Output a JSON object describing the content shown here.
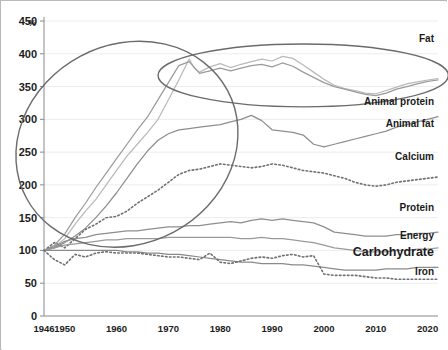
{
  "chart_data": {
    "type": "line",
    "title": "",
    "subtitle": "",
    "xlabel": "",
    "ylabel": "%",
    "ylim": [
      0,
      450
    ],
    "xlim": [
      1946,
      2022
    ],
    "grid": true,
    "legend_position": "right-inline",
    "yticks": [
      0,
      50,
      100,
      150,
      200,
      250,
      300,
      350,
      400,
      450
    ],
    "xticks": [
      1946,
      1950,
      1960,
      1970,
      1980,
      1990,
      2000,
      2010,
      2020
    ],
    "axis_note": "Index, 1946 = 100%",
    "series": [
      {
        "name": "Fat",
        "color": "#b9b9b9",
        "style": "solid",
        "label_x": 1999,
        "label_y": 418,
        "x": [
          1946,
          1948,
          1950,
          1952,
          1954,
          1956,
          1958,
          1960,
          1962,
          1964,
          1966,
          1968,
          1970,
          1972,
          1974,
          1975,
          1976,
          1978,
          1980,
          1982,
          1984,
          1986,
          1988,
          1990,
          1992,
          1994,
          1996,
          1998,
          2000,
          2002,
          2004,
          2006,
          2008,
          2010,
          2012,
          2014,
          2016,
          2018,
          2020,
          2022
        ],
        "values": [
          100,
          105,
          118,
          140,
          160,
          178,
          200,
          222,
          244,
          262,
          280,
          300,
          330,
          360,
          392,
          378,
          372,
          380,
          385,
          379,
          384,
          388,
          392,
          389,
          396,
          393,
          383,
          372,
          361,
          352,
          347,
          344,
          340,
          339,
          344,
          349,
          354,
          357,
          360,
          362
        ]
      },
      {
        "name": "Animal protein",
        "color": "#9b9b9b",
        "style": "solid",
        "label_x": 2004,
        "label_y": 322,
        "x": [
          1946,
          1948,
          1950,
          1952,
          1954,
          1956,
          1958,
          1960,
          1962,
          1964,
          1966,
          1968,
          1970,
          1972,
          1974,
          1976,
          1978,
          1980,
          1982,
          1984,
          1986,
          1988,
          1990,
          1992,
          1994,
          1996,
          1998,
          2000,
          2002,
          2004,
          2006,
          2008,
          2010,
          2012,
          2014,
          2016,
          2018,
          2020,
          2022
        ],
        "values": [
          100,
          108,
          125,
          150,
          172,
          196,
          218,
          240,
          262,
          284,
          304,
          330,
          356,
          382,
          388,
          370,
          374,
          378,
          374,
          378,
          382,
          384,
          380,
          386,
          381,
          372,
          364,
          356,
          350,
          346,
          342,
          338,
          336,
          340,
          346,
          350,
          354,
          358,
          360
        ]
      },
      {
        "name": "Animal fat",
        "color": "#8e8e8e",
        "style": "solid",
        "label_x": 2006,
        "label_y": 288,
        "x": [
          1946,
          1948,
          1950,
          1952,
          1954,
          1956,
          1958,
          1960,
          1962,
          1964,
          1966,
          1968,
          1970,
          1972,
          1974,
          1976,
          1978,
          1980,
          1982,
          1984,
          1986,
          1988,
          1990,
          1992,
          1994,
          1996,
          1998,
          2000,
          2002,
          2004,
          2006,
          2008,
          2010,
          2012,
          2014,
          2016,
          2018,
          2020,
          2022
        ],
        "values": [
          100,
          104,
          112,
          122,
          134,
          150,
          168,
          188,
          210,
          232,
          252,
          268,
          278,
          284,
          286,
          288,
          290,
          292,
          296,
          300,
          306,
          298,
          284,
          282,
          280,
          276,
          262,
          258,
          262,
          266,
          270,
          274,
          278,
          282,
          288,
          292,
          296,
          300,
          304
        ]
      },
      {
        "name": "Calcium",
        "color": "#707070",
        "style": "dotted",
        "label_x": 2006,
        "label_y": 238,
        "x": [
          1946,
          1948,
          1950,
          1952,
          1954,
          1956,
          1958,
          1960,
          1962,
          1964,
          1966,
          1968,
          1970,
          1972,
          1974,
          1976,
          1978,
          1980,
          1982,
          1984,
          1986,
          1988,
          1990,
          1992,
          1994,
          1996,
          1998,
          2000,
          2002,
          2004,
          2006,
          2008,
          2010,
          2012,
          2014,
          2016,
          2018,
          2020,
          2022
        ],
        "values": [
          100,
          112,
          104,
          118,
          132,
          140,
          150,
          152,
          160,
          172,
          182,
          192,
          204,
          216,
          222,
          224,
          228,
          232,
          230,
          228,
          226,
          228,
          232,
          230,
          226,
          222,
          220,
          218,
          214,
          210,
          204,
          200,
          198,
          200,
          204,
          206,
          208,
          210,
          212
        ]
      },
      {
        "name": "Protein",
        "color": "#8e8e8e",
        "style": "solid",
        "label_x": 2005,
        "label_y": 160,
        "x": [
          1946,
          1948,
          1950,
          1952,
          1954,
          1956,
          1958,
          1960,
          1962,
          1964,
          1966,
          1968,
          1970,
          1972,
          1974,
          1976,
          1978,
          1980,
          1982,
          1984,
          1986,
          1988,
          1990,
          1992,
          1994,
          1996,
          1998,
          2000,
          2002,
          2004,
          2006,
          2008,
          2010,
          2012,
          2014,
          2016,
          2018,
          2020,
          2022
        ],
        "values": [
          100,
          106,
          114,
          118,
          120,
          124,
          126,
          128,
          130,
          130,
          132,
          134,
          136,
          136,
          138,
          138,
          140,
          142,
          144,
          142,
          146,
          148,
          146,
          148,
          146,
          144,
          142,
          136,
          128,
          126,
          124,
          122,
          122,
          122,
          124,
          124,
          126,
          126,
          128
        ]
      },
      {
        "name": "Energy",
        "color": "#9a9a9a",
        "style": "solid",
        "label_x": 2011,
        "label_y": 118,
        "x": [
          1946,
          1948,
          1950,
          1952,
          1954,
          1956,
          1958,
          1960,
          1962,
          1964,
          1966,
          1968,
          1970,
          1972,
          1974,
          1976,
          1978,
          1980,
          1982,
          1984,
          1986,
          1988,
          1990,
          1992,
          1994,
          1996,
          1998,
          2000,
          2002,
          2004,
          2006,
          2008,
          2010,
          2012,
          2014,
          2016,
          2018,
          2020,
          2022
        ],
        "values": [
          100,
          104,
          108,
          110,
          112,
          114,
          116,
          116,
          118,
          118,
          118,
          118,
          120,
          120,
          120,
          120,
          120,
          120,
          120,
          118,
          118,
          120,
          118,
          118,
          116,
          114,
          112,
          108,
          104,
          102,
          100,
          98,
          98,
          98,
          100,
          100,
          102,
          102,
          104
        ]
      },
      {
        "name": "Carbohydrate",
        "color": "#8a8a8a",
        "style": "solid",
        "label_x": 1998,
        "label_y": 92,
        "x": [
          1946,
          1948,
          1950,
          1952,
          1954,
          1956,
          1958,
          1960,
          1962,
          1964,
          1966,
          1968,
          1970,
          1972,
          1974,
          1976,
          1978,
          1980,
          1982,
          1984,
          1986,
          1988,
          1990,
          1992,
          1994,
          1996,
          1998,
          2000,
          2002,
          2004,
          2006,
          2008,
          2010,
          2012,
          2014,
          2016,
          2018,
          2020,
          2022
        ],
        "values": [
          100,
          100,
          100,
          100,
          100,
          100,
          100,
          100,
          98,
          98,
          96,
          96,
          94,
          94,
          92,
          90,
          88,
          86,
          84,
          82,
          82,
          80,
          80,
          80,
          78,
          78,
          76,
          74,
          72,
          70,
          70,
          70,
          70,
          72,
          72,
          72,
          74,
          74,
          74
        ]
      },
      {
        "name": "Iron",
        "color": "#707070",
        "style": "dotted",
        "label_x": 2013,
        "label_y": 62,
        "x": [
          1946,
          1948,
          1950,
          1952,
          1954,
          1956,
          1958,
          1960,
          1962,
          1964,
          1966,
          1968,
          1970,
          1972,
          1974,
          1976,
          1978,
          1980,
          1982,
          1984,
          1986,
          1988,
          1990,
          1992,
          1994,
          1996,
          1998,
          2000,
          2002,
          2004,
          2006,
          2008,
          2010,
          2012,
          2014,
          2016,
          2018,
          2020,
          2022
        ],
        "values": [
          100,
          86,
          78,
          94,
          90,
          96,
          98,
          96,
          96,
          96,
          94,
          92,
          90,
          90,
          88,
          86,
          96,
          82,
          80,
          84,
          88,
          90,
          88,
          92,
          94,
          90,
          92,
          64,
          62,
          62,
          62,
          60,
          58,
          58,
          56,
          56,
          56,
          56,
          56
        ]
      }
    ],
    "annotations": [
      {
        "name": "rising-phase-ellipse",
        "shape": "ellipse",
        "cx": 1962,
        "cy": 262,
        "rx": 22,
        "ry": 152,
        "rotation_deg": -28
      },
      {
        "name": "plateau-phase-ellipse",
        "shape": "ellipse",
        "cx": 1996,
        "cy": 367,
        "rx": 28,
        "ry": 48,
        "rotation_deg": 0
      }
    ]
  },
  "labels": {
    "unit": "%",
    "fat": "Fat",
    "animal_protein": "Animal protein",
    "animal_fat": "Animal fat",
    "calcium": "Calcium",
    "protein": "Protein",
    "energy": "Energy",
    "carbohydrate": "Carbohydrate",
    "iron": "Iron"
  },
  "yticks_text": [
    "450",
    "400",
    "350",
    "300",
    "250",
    "200",
    "150",
    "100",
    "50",
    "0"
  ],
  "xticks_text": [
    "1946",
    "1950",
    "1960",
    "1970",
    "1980",
    "1990",
    "2000",
    "2010",
    "2020"
  ]
}
